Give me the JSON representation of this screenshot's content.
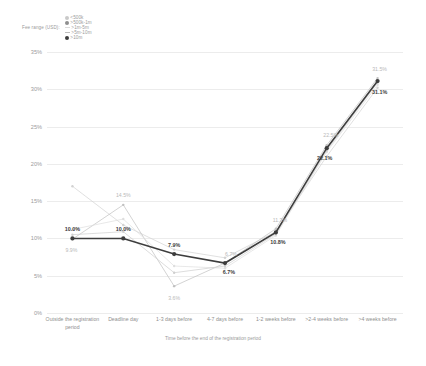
{
  "legend": {
    "title": "Fee range (USD):",
    "items": [
      {
        "label": "<500k",
        "color": "#c9c9c9",
        "marker": "dot"
      },
      {
        "label": ">500k-1m",
        "color": "#8f8f8f",
        "marker": "dot"
      },
      {
        "label": ">1m-5m",
        "color": "#dcdcdc",
        "marker": "line"
      },
      {
        "label": ">5m-10m",
        "color": "#bdbdbd",
        "marker": "line"
      },
      {
        "label": ">10m",
        "color": "#3d3d3d",
        "marker": "dot"
      }
    ]
  },
  "axes": {
    "y_ticks": [
      "35%",
      "30%",
      "25%",
      "20%",
      "15%",
      "10%",
      "5%",
      "0%"
    ],
    "x_labels": [
      "Outside the registration period",
      "Deadline day",
      "1-3 days before",
      "4-7 days before",
      "1-2 weeks before",
      ">2-4 weeks before",
      ">4 weeks before"
    ],
    "x_title": "Time before the end of the registration period"
  },
  "chart_data": {
    "type": "line",
    "title": "",
    "xlabel": "Time before the end of the registration period",
    "ylabel": "",
    "ylim": [
      0,
      35
    ],
    "ytick_values": [
      0,
      5,
      10,
      15,
      20,
      25,
      30,
      35
    ],
    "grid": true,
    "legend_position": "top-left",
    "legend_title": "Fee range (USD):",
    "categories": [
      "Outside the registration period",
      "Deadline day",
      "1-3 days before",
      "4-7 days before",
      "1-2 weeks before",
      ">2-4 weeks before",
      ">4 weeks before"
    ],
    "series": [
      {
        "name": "<500k",
        "color": "#d2d2d2",
        "emphasis": false,
        "values": [
          17.0,
          11.8,
          8.5,
          7.4,
          10.9,
          21.0,
          30.2
        ],
        "labels": [
          "",
          "",
          "",
          "",
          "",
          "",
          ""
        ]
      },
      {
        "name": ">500k-1m",
        "color": "#c0c0c0",
        "emphasis": false,
        "values": [
          9.9,
          14.5,
          3.6,
          6.7,
          11.3,
          22.5,
          31.5
        ],
        "labels": [
          "9.9%",
          "14.5%",
          "3.6%",
          "6.7%",
          "11.3%",
          "22.5%",
          "31.5%"
        ]
      },
      {
        "name": ">1m-5m",
        "color": "#dedede",
        "emphasis": false,
        "values": [
          11.2,
          12.6,
          6.3,
          6.0,
          10.4,
          21.6,
          30.6
        ],
        "labels": [
          "",
          "",
          "",
          "",
          "",
          "",
          ""
        ]
      },
      {
        "name": ">5m-10m",
        "color": "#cfcfcf",
        "emphasis": false,
        "values": [
          10.5,
          10.9,
          5.4,
          6.3,
          10.6,
          21.8,
          30.9
        ],
        "labels": [
          "",
          "",
          "",
          "",
          "",
          "",
          ""
        ]
      },
      {
        "name": ">10m",
        "color": "#3d3d3d",
        "emphasis": true,
        "values": [
          10.0,
          10.0,
          7.9,
          6.7,
          10.8,
          22.1,
          31.1
        ],
        "labels": [
          "10.0%",
          "10.0%",
          "7.9%",
          "6.7%",
          "10.8%",
          "22.1%",
          "31.1%"
        ]
      }
    ]
  }
}
